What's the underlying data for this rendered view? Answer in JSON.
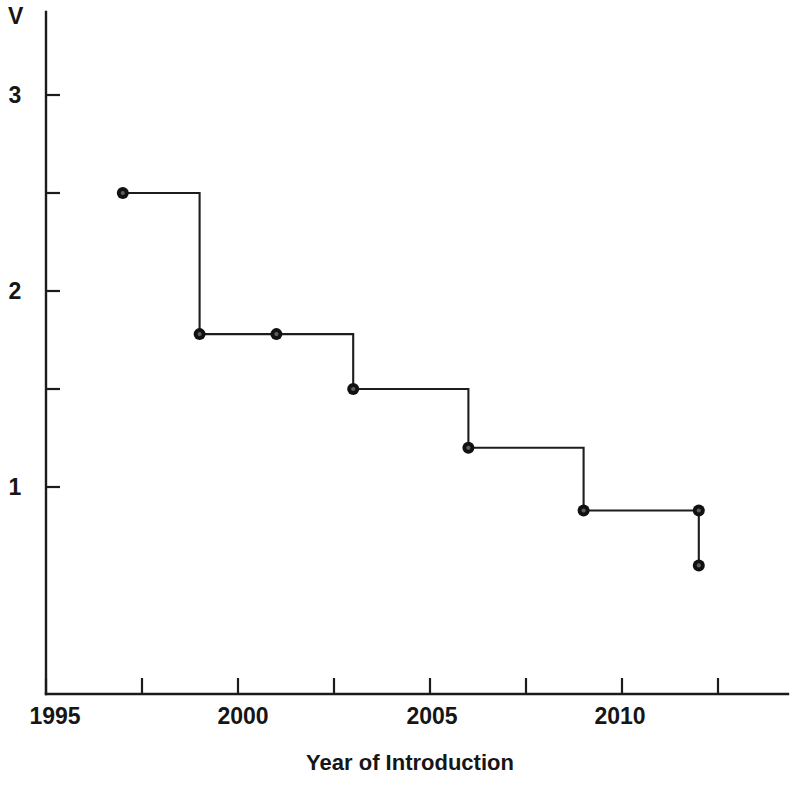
{
  "chart_data": {
    "type": "line",
    "subtype": "step-post",
    "title": "",
    "xlabel": "Year of Introduction",
    "ylabel": "V",
    "xlim": [
      1995,
      2013.1
    ],
    "ylim": [
      0.18,
      3.25
    ],
    "grid": false,
    "legend": null,
    "x_ticks": [
      1995,
      1997.5,
      2000,
      2002.5,
      2005,
      2007.5,
      2010,
      2012.5
    ],
    "x_tick_labels": [
      "1995",
      "",
      "2000",
      "",
      "2005",
      "",
      "2010",
      ""
    ],
    "x_labeled_ticks": [
      {
        "value": 1995,
        "label": "1995"
      },
      {
        "value": 2000,
        "label": "2000"
      },
      {
        "value": 2005,
        "label": "2005"
      },
      {
        "value": 2010,
        "label": "2010"
      }
    ],
    "y_ticks": [
      1,
      1.5,
      2,
      2.5,
      3
    ],
    "y_tick_labels": [
      "1",
      "",
      "2",
      "",
      "3"
    ],
    "y_labeled_ticks": [
      {
        "value": 1,
        "label": "1"
      },
      {
        "value": 2,
        "label": "2"
      },
      {
        "value": 3,
        "label": "3"
      }
    ],
    "x": [
      1997,
      1999,
      2001,
      2003,
      2006,
      2009,
      2012,
      2012
    ],
    "values": [
      2.5,
      1.78,
      1.78,
      1.5,
      1.2,
      0.88,
      0.88,
      0.6
    ],
    "points": [
      {
        "x": 1997,
        "y": 2.5
      },
      {
        "x": 1999,
        "y": 1.78
      },
      {
        "x": 2001,
        "y": 1.78
      },
      {
        "x": 2003,
        "y": 1.5
      },
      {
        "x": 2006,
        "y": 1.2
      },
      {
        "x": 2009,
        "y": 0.88
      },
      {
        "x": 2012,
        "y": 0.88
      },
      {
        "x": 2012,
        "y": 0.6
      }
    ],
    "marker": "circle-ring",
    "line_color": "#1d1d1d",
    "marker_color": "#111111"
  },
  "axis": {
    "y_axis_label": "V",
    "x_axis_label": "Year of Introduction"
  }
}
